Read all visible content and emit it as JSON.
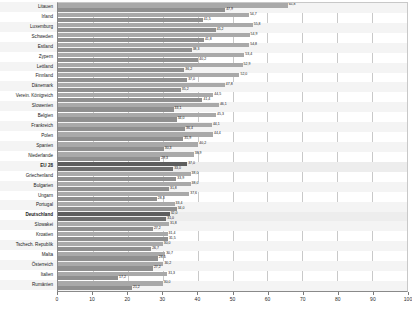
{
  "chart_data": {
    "type": "bar",
    "orientation": "horizontal",
    "title": "",
    "subtitle": "",
    "xlabel": "",
    "ylabel": "",
    "xlim": [
      0,
      100
    ],
    "xticks": [
      0,
      10,
      20,
      30,
      40,
      50,
      60,
      70,
      80,
      90,
      100
    ],
    "xticklabels": [
      "0",
      "10",
      "20",
      "30",
      "40",
      "50",
      "60",
      "70",
      "80",
      "90",
      "100"
    ],
    "grid": true,
    "legend": "none",
    "categories": [
      "Litauen",
      "Irland",
      "Luxemburg",
      "Schweden",
      "Estland",
      "Zypern",
      "Lettland",
      "Finnland",
      "Dänemark",
      "Verein. Königreich",
      "Slowenien",
      "Belgien",
      "Frankreich",
      "Polen",
      "Spanien",
      "Niederlande",
      "EU 28",
      "Griechenland",
      "Bulgarien",
      "Ungarn",
      "Portugal",
      "Deutschland",
      "Slowakei",
      "Kroatien",
      "Tschech. Republik",
      "Malta",
      "Österreich",
      "Italien",
      "Rumänien"
    ],
    "highlighted": [
      "EU 28",
      "Deutschland"
    ],
    "series": [
      {
        "name": "Frauen",
        "color": "#a9a9a9",
        "values": [
          65.8,
          54.7,
          55.8,
          54.9,
          54.8,
          53.4,
          52.9,
          52.0,
          47.8,
          44.5,
          46.1,
          45.3,
          44.1,
          44.4,
          40.2,
          38.9,
          37.0,
          38.0,
          38.0,
          37.6,
          33.4,
          32.0,
          31.8,
          31.4,
          30.0,
          30.7,
          30.2,
          31.3,
          30.0
        ]
      },
      {
        "name": "Männer",
        "color": "#8f8f8f",
        "values": [
          47.9,
          41.5,
          45.2,
          41.8,
          38.3,
          40.2,
          36.2,
          37.0,
          35.2,
          41.4,
          33.1,
          34.0,
          36.4,
          35.9,
          30.3,
          29.3,
          33.0,
          33.9,
          31.8,
          28.3,
          34.0,
          31.0,
          27.2,
          31.5,
          26.7,
          28.6,
          27.2,
          17.2,
          21.2
        ]
      }
    ]
  }
}
